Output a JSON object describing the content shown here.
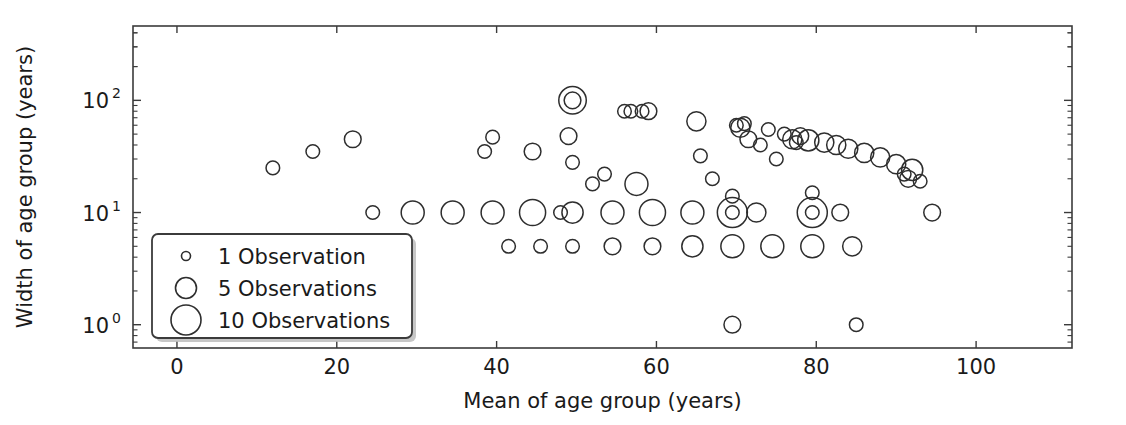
{
  "chart_data": {
    "type": "scatter",
    "title": "",
    "xlabel": "Mean of age group (years)",
    "ylabel": "Width of age group (years)",
    "xscale": "linear",
    "yscale": "log",
    "xlim": [
      -5.5,
      112
    ],
    "ylim": [
      0.62,
      460
    ],
    "grid": false,
    "legend_position": "lower left",
    "marker": "open-circle",
    "size_encoding": "number of observations",
    "xticks": [
      0,
      20,
      40,
      60,
      80,
      100
    ],
    "xtick_labels": [
      "0",
      "20",
      "40",
      "60",
      "80",
      "100"
    ],
    "yticks": [
      1,
      10,
      100
    ],
    "ytick_labels": [
      "10^0",
      "10^1",
      "10^2"
    ],
    "ytick_mantissa": [
      "10",
      "10",
      "10"
    ],
    "ytick_exponent": [
      "0",
      "1",
      "2"
    ],
    "legend": [
      {
        "label": "1 Observation",
        "n": 1,
        "marker_radius": 4.5
      },
      {
        "label": "5 Observations",
        "n": 5,
        "marker_radius": 10.5
      },
      {
        "label": "10 Observations",
        "n": 10,
        "marker_radius": 15
      }
    ],
    "points": [
      {
        "x": 12,
        "y": 25,
        "n": 1
      },
      {
        "x": 17,
        "y": 35,
        "n": 1
      },
      {
        "x": 22,
        "y": 45,
        "n": 2
      },
      {
        "x": 24.5,
        "y": 10,
        "n": 1
      },
      {
        "x": 29.5,
        "y": 10,
        "n": 5
      },
      {
        "x": 34.5,
        "y": 10,
        "n": 5
      },
      {
        "x": 38.5,
        "y": 35,
        "n": 1
      },
      {
        "x": 39.5,
        "y": 47,
        "n": 1
      },
      {
        "x": 39.5,
        "y": 10,
        "n": 5
      },
      {
        "x": 41.5,
        "y": 5,
        "n": 1
      },
      {
        "x": 44.5,
        "y": 10,
        "n": 7
      },
      {
        "x": 44.5,
        "y": 35,
        "n": 2
      },
      {
        "x": 45.5,
        "y": 5,
        "n": 1
      },
      {
        "x": 48,
        "y": 10,
        "n": 1
      },
      {
        "x": 49,
        "y": 48,
        "n": 2
      },
      {
        "x": 49.5,
        "y": 28,
        "n": 1
      },
      {
        "x": 49.5,
        "y": 10,
        "n": 4
      },
      {
        "x": 49.5,
        "y": 100,
        "n": 8
      },
      {
        "x": 49.5,
        "y": 100,
        "n": 2
      },
      {
        "x": 49.5,
        "y": 5,
        "n": 1
      },
      {
        "x": 52,
        "y": 18,
        "n": 1
      },
      {
        "x": 53.5,
        "y": 22,
        "n": 1
      },
      {
        "x": 54.5,
        "y": 10,
        "n": 5
      },
      {
        "x": 54.5,
        "y": 5,
        "n": 2
      },
      {
        "x": 56,
        "y": 80,
        "n": 1
      },
      {
        "x": 56.8,
        "y": 80,
        "n": 1
      },
      {
        "x": 57.5,
        "y": 18,
        "n": 5
      },
      {
        "x": 58.2,
        "y": 80,
        "n": 1
      },
      {
        "x": 59,
        "y": 80,
        "n": 2
      },
      {
        "x": 59.5,
        "y": 10,
        "n": 7
      },
      {
        "x": 59.5,
        "y": 5,
        "n": 2
      },
      {
        "x": 64.5,
        "y": 10,
        "n": 5
      },
      {
        "x": 64.5,
        "y": 5,
        "n": 4
      },
      {
        "x": 65,
        "y": 65,
        "n": 3
      },
      {
        "x": 65.5,
        "y": 32,
        "n": 1
      },
      {
        "x": 67,
        "y": 20,
        "n": 1
      },
      {
        "x": 69.5,
        "y": 10,
        "n": 10
      },
      {
        "x": 69.5,
        "y": 10,
        "n": 1
      },
      {
        "x": 69.5,
        "y": 14,
        "n": 1
      },
      {
        "x": 69.5,
        "y": 5,
        "n": 5
      },
      {
        "x": 69.5,
        "y": 1,
        "n": 2
      },
      {
        "x": 70,
        "y": 60,
        "n": 1
      },
      {
        "x": 70.5,
        "y": 57,
        "n": 3
      },
      {
        "x": 71,
        "y": 62,
        "n": 1
      },
      {
        "x": 71.5,
        "y": 45,
        "n": 2
      },
      {
        "x": 72.5,
        "y": 10,
        "n": 3
      },
      {
        "x": 73,
        "y": 40,
        "n": 1
      },
      {
        "x": 74,
        "y": 55,
        "n": 1
      },
      {
        "x": 74.5,
        "y": 5,
        "n": 5
      },
      {
        "x": 75,
        "y": 30,
        "n": 1
      },
      {
        "x": 76,
        "y": 50,
        "n": 1
      },
      {
        "x": 77,
        "y": 45,
        "n": 3
      },
      {
        "x": 77.5,
        "y": 42,
        "n": 1
      },
      {
        "x": 78,
        "y": 48,
        "n": 2
      },
      {
        "x": 79,
        "y": 44,
        "n": 4
      },
      {
        "x": 79.5,
        "y": 10,
        "n": 10
      },
      {
        "x": 79.5,
        "y": 10,
        "n": 1
      },
      {
        "x": 79.5,
        "y": 15,
        "n": 1
      },
      {
        "x": 79.5,
        "y": 5,
        "n": 5
      },
      {
        "x": 81,
        "y": 42,
        "n": 3
      },
      {
        "x": 82.5,
        "y": 40,
        "n": 3
      },
      {
        "x": 83,
        "y": 10,
        "n": 2
      },
      {
        "x": 84,
        "y": 37,
        "n": 3
      },
      {
        "x": 84.5,
        "y": 5,
        "n": 3
      },
      {
        "x": 85,
        "y": 1,
        "n": 1
      },
      {
        "x": 86,
        "y": 34,
        "n": 3
      },
      {
        "x": 88,
        "y": 31,
        "n": 3
      },
      {
        "x": 90,
        "y": 27,
        "n": 3
      },
      {
        "x": 91,
        "y": 22,
        "n": 1
      },
      {
        "x": 91.5,
        "y": 20,
        "n": 2
      },
      {
        "x": 92,
        "y": 24,
        "n": 4
      },
      {
        "x": 93,
        "y": 19,
        "n": 1
      },
      {
        "x": 94.5,
        "y": 10,
        "n": 2
      }
    ]
  }
}
